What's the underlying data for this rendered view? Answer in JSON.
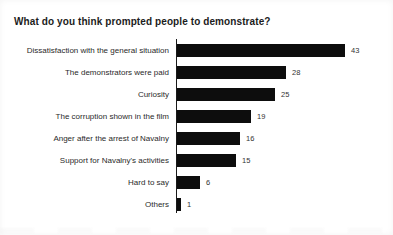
{
  "chart_data": {
    "type": "bar",
    "orientation": "horizontal",
    "title": "What do you think prompted people to demonstrate?",
    "categories": [
      "Dissatisfaction with the general situation",
      "The demonstrators were paid",
      "Curiosity",
      "The corruption shown in the film",
      "Anger after the arrest of Navalny",
      "Support for Navalny's activities",
      "Hard to say",
      "Others"
    ],
    "values": [
      43,
      28,
      25,
      19,
      16,
      15,
      6,
      1
    ],
    "value_labels_shown": true,
    "xlim": [
      0,
      45
    ],
    "grid": false,
    "legend": "none",
    "bar_color": "#0d0d0d",
    "axis_color": "#1a1a1a",
    "background_color": "#ffffff"
  }
}
